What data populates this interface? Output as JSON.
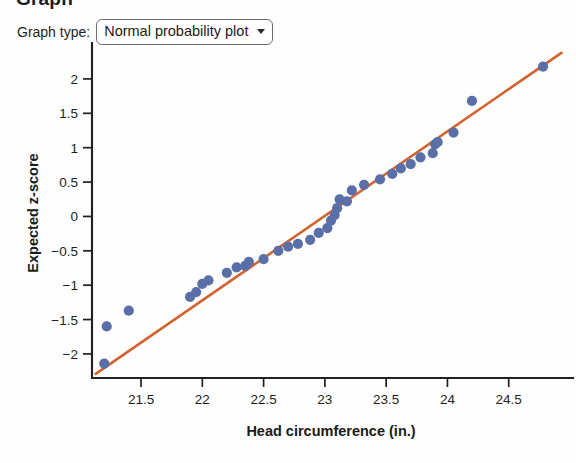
{
  "header": {
    "clipped_title": "Graph",
    "control_label": "Graph type:",
    "selected_option": "Normal probability plot",
    "caret_icon": "chevron-down-icon"
  },
  "colors": {
    "point": "#5a6ea8",
    "line": "#d4622f",
    "axis": "#231f20",
    "background": "#fefefe"
  },
  "chart_data": {
    "type": "scatter",
    "title": "",
    "xlabel": "Head circumference (in.)",
    "ylabel": "Expected z-score",
    "xlim": [
      21.1,
      25.0
    ],
    "ylim": [
      -2.35,
      2.45
    ],
    "xticks": [
      21.5,
      22,
      22.5,
      23,
      23.5,
      24,
      24.5
    ],
    "xticklabels": [
      "21.5",
      "22",
      "22.5",
      "23",
      "23.5",
      "24",
      "24.5"
    ],
    "yticks": [
      2,
      1.5,
      1,
      0.5,
      0,
      -0.5,
      -1,
      -1.5,
      -2
    ],
    "yticklabels": [
      "2",
      "1.5",
      "1",
      "0.5",
      "0",
      "−0.5",
      "−1",
      "−1.5",
      "−2"
    ],
    "grid": false,
    "legend": null,
    "series": [
      {
        "name": "Observations",
        "marker": "circle",
        "color": "#5a6ea8",
        "x": [
          21.2,
          21.22,
          21.4,
          21.9,
          21.95,
          22.0,
          22.05,
          22.2,
          22.28,
          22.35,
          22.38,
          22.5,
          22.62,
          22.7,
          22.78,
          22.88,
          22.95,
          23.02,
          23.05,
          23.08,
          23.1,
          23.12,
          23.18,
          23.22,
          23.32,
          23.45,
          23.55,
          23.62,
          23.7,
          23.78,
          23.88,
          23.9,
          23.92,
          24.05,
          24.2,
          24.78
        ],
        "y": [
          -2.14,
          -1.6,
          -1.37,
          -1.17,
          -1.1,
          -0.98,
          -0.93,
          -0.82,
          -0.74,
          -0.72,
          -0.66,
          -0.62,
          -0.5,
          -0.44,
          -0.4,
          -0.34,
          -0.24,
          -0.17,
          -0.06,
          0.02,
          0.12,
          0.25,
          0.22,
          0.38,
          0.46,
          0.54,
          0.62,
          0.7,
          0.76,
          0.86,
          0.92,
          1.05,
          1.08,
          1.22,
          1.68,
          2.18
        ]
      }
    ],
    "fit_line": {
      "name": "Reference line",
      "color": "#d4622f",
      "x": [
        21.13,
        24.93
      ],
      "y": [
        -2.29,
        2.38
      ]
    }
  }
}
